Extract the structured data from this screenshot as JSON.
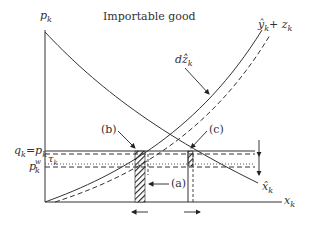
{
  "title": "Importable good",
  "axes": {
    "y_label": "p",
    "y_label_sub": "k",
    "x_label": "x",
    "x_label_sub": "k"
  },
  "curves": {
    "supply_label": "ŷ",
    "supply_label_sub": "k",
    "supply_label_plus": "+ z",
    "supply_label_plus_sub": "k",
    "demand_label": "x̂",
    "demand_label_sub": "k",
    "shift_label": "dẑ",
    "shift_label_sub": "k"
  },
  "price_levels": {
    "domestic": "q",
    "domestic_sub": "k",
    "domestic_eq": "=p",
    "domestic_eq_sub": "k",
    "tariff": "τ",
    "tariff_sub": "k",
    "world": "p",
    "world_sub": "k",
    "world_sup": "w"
  },
  "annotations": {
    "a": "(a)",
    "b": "(b)",
    "c": "(c)"
  },
  "colors": {
    "line": "#333333",
    "background": "#ffffff"
  }
}
